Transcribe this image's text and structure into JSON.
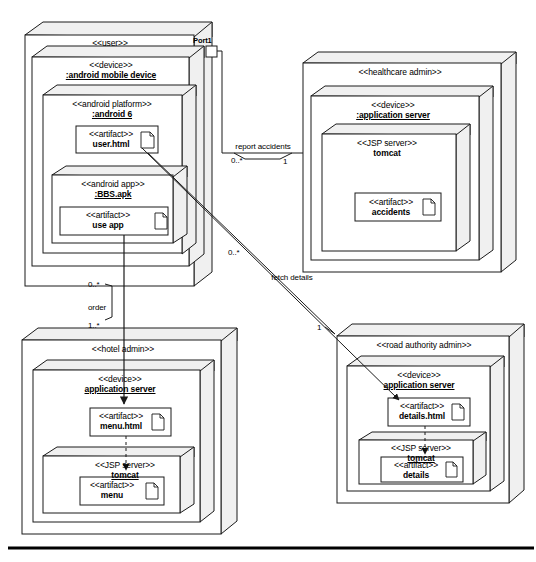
{
  "diagram": {
    "kind": "uml-deployment-diagram",
    "stroke_color": "#1a1a1a",
    "fill_color": "#ffffff",
    "side_fill": "#f0f0f0",
    "baseline_rule_color": "#000000"
  },
  "nodes": {
    "user": {
      "stereotype": "<<user>>",
      "port": {
        "label": "Port1"
      },
      "device": {
        "stereotype": "<<device>>",
        "instance": ":android mobile device",
        "platform": {
          "stereotype": "<<android platform>>",
          "instance": ":android 6",
          "artifact_user_html": {
            "stereotype": "<<artifact>>",
            "name": "user.html"
          },
          "app": {
            "stereotype": "<<android app>>",
            "instance": ":BBS.apk",
            "artifact_use_app": {
              "stereotype": "<<artifact>>",
              "name": "use app"
            }
          }
        }
      }
    },
    "healthcare": {
      "stereotype": "<<healthcare admin>>",
      "device": {
        "stereotype": "<<device>>",
        "instance": ":application server",
        "jsp": {
          "stereotype": "<<JSP server>>",
          "name": "tomcat",
          "artifact": {
            "stereotype": "<<artifact>>",
            "name": "accidents"
          }
        }
      }
    },
    "hotel": {
      "stereotype": "<<hotel admin>>",
      "device": {
        "stereotype": "<<device>>",
        "instance": "application server",
        "artifact_menu_html": {
          "stereotype": "<<artifact>>",
          "name": "menu.html"
        },
        "jsp": {
          "stereotype": "<<JSP server>>",
          "instance": "tomcat",
          "artifact": {
            "stereotype": "<<artifact>>",
            "name": "menu"
          }
        }
      }
    },
    "road": {
      "stereotype": "<<road authority admin>>",
      "device": {
        "stereotype": "<<device>>",
        "instance": "application server",
        "artifact_details_html": {
          "stereotype": "<<artifact>>",
          "name": "details.html"
        },
        "jsp": {
          "stereotype": "<<JSP server>>",
          "instance": "tomcat",
          "artifact": {
            "stereotype": "<<artifact>>",
            "name": "details"
          }
        }
      }
    }
  },
  "edges": {
    "report_accidents": {
      "label": "report accidents",
      "source_multiplicity": "0..*",
      "target_multiplicity": "1"
    },
    "fetch_details": {
      "label": "fetch details",
      "source_multiplicity": "0..*",
      "target_multiplicity": "1"
    },
    "order": {
      "label": "order",
      "source_multiplicity": "0..*",
      "target_multiplicity": "1..*"
    }
  }
}
